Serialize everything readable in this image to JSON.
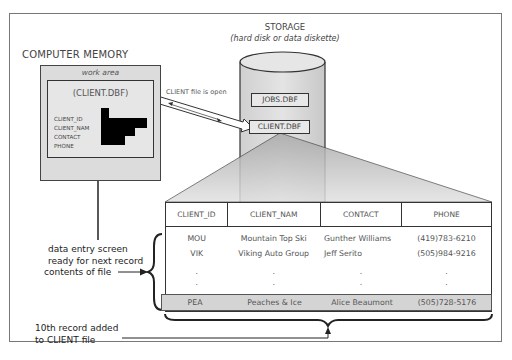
{
  "memory": {
    "title": "COMPUTER MEMORY",
    "work_area_label": "work area",
    "open_file": "(CLIENT.DBF)",
    "fields": [
      "CLIENT_ID",
      "CLIENT_NAM",
      "CONTACT",
      "PHONE"
    ],
    "caption_line1": "data entry screen",
    "caption_line2": "ready for next record"
  },
  "storage": {
    "title": "STORAGE",
    "subtitle": "(hard disk or data diskette)",
    "files": [
      "JOBS.DBF",
      "CLIENT.DBF"
    ]
  },
  "connection": {
    "label": "CLIENT file is open"
  },
  "table": {
    "headers": [
      "CLIENT_ID",
      "CLIENT_NAM",
      "CONTACT",
      "PHONE"
    ],
    "rows": [
      [
        "MOU",
        "Mountain Top Ski",
        "Gunther Williams",
        "(419)783-6210"
      ],
      [
        "VIK",
        "Viking Auto Group",
        "Jeff Serito",
        "(505)984-9216"
      ]
    ],
    "ellipsis": ".",
    "new_row": [
      "PEA",
      "Peaches & Ice",
      "Alice Beaumont",
      "(505)728-5176"
    ]
  },
  "annotations": {
    "contents": "contents of file",
    "added_line1": "10th record added",
    "added_line2": "to CLIENT file"
  },
  "colors": {
    "panel_gray": "#dcdcdc",
    "highlight_row": "#d4d4d4",
    "line": "#333333"
  }
}
